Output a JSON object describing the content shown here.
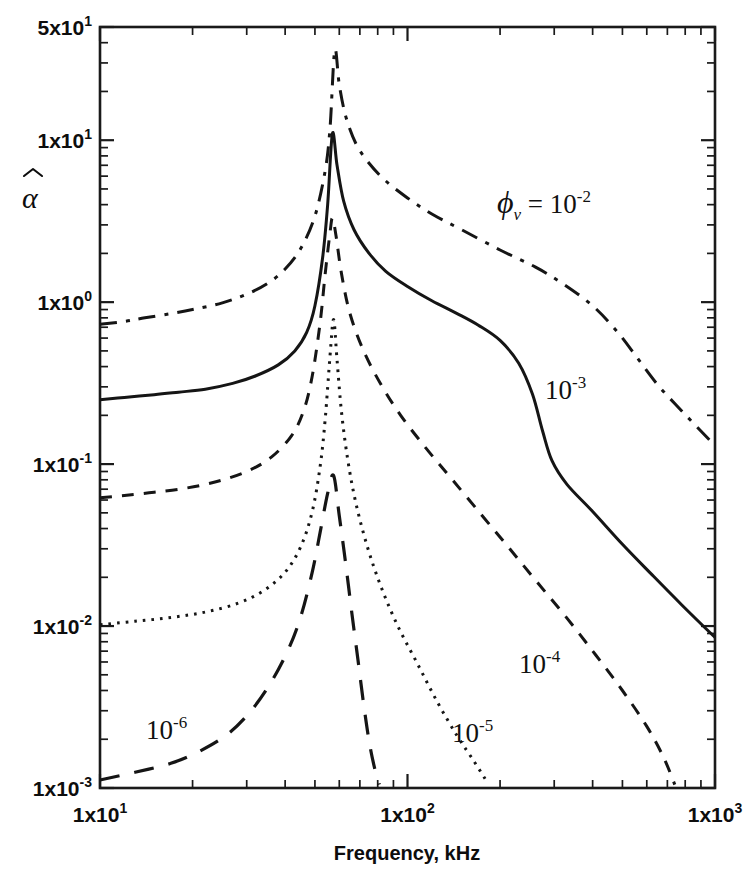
{
  "figure": {
    "background": "#ffffff",
    "ink_color": "#151515"
  },
  "axes": {
    "x": {
      "title": "Frequency, kHz",
      "scale": "log",
      "min": 10,
      "max": 1000,
      "tick_labels": [
        {
          "value": 10,
          "mantissa": "1x10",
          "exponent": "1"
        },
        {
          "value": 100,
          "mantissa": "1x10",
          "exponent": "2"
        },
        {
          "value": 1000,
          "mantissa": "1x10",
          "exponent": "3"
        }
      ]
    },
    "y": {
      "title": "α̂",
      "title_glyph": "α",
      "scale": "log",
      "min": 0.001,
      "max": 50,
      "tick_labels": [
        {
          "value": 50,
          "mantissa": "5x10",
          "exponent": "1"
        },
        {
          "value": 10,
          "mantissa": "1x10",
          "exponent": "1"
        },
        {
          "value": 1,
          "mantissa": "1x10",
          "exponent": "0"
        },
        {
          "value": 0.1,
          "mantissa": "1x10",
          "exponent": "-1"
        },
        {
          "value": 0.01,
          "mantissa": "1x10",
          "exponent": "-2"
        },
        {
          "value": 0.001,
          "mantissa": "1x10",
          "exponent": "-3"
        }
      ]
    }
  },
  "annotations": [
    {
      "id": "phi-1e-2",
      "prefix": "ϕ",
      "subscript": "v",
      "equals": " = ",
      "base": "10",
      "exponent": "-2",
      "x": 497,
      "y": 213
    },
    {
      "id": "phi-1e-3",
      "prefix": "",
      "subscript": "",
      "equals": "",
      "base": "10",
      "exponent": "-3",
      "x": 545,
      "y": 399
    },
    {
      "id": "phi-1e-4",
      "prefix": "",
      "subscript": "",
      "equals": "",
      "base": "10",
      "exponent": "-4",
      "x": 519,
      "y": 673
    },
    {
      "id": "phi-1e-5",
      "prefix": "",
      "subscript": "",
      "equals": "",
      "base": "10",
      "exponent": "-5",
      "x": 452,
      "y": 742
    },
    {
      "id": "phi-1e-6",
      "prefix": "",
      "subscript": "",
      "equals": "",
      "base": "10",
      "exponent": "-6",
      "x": 146,
      "y": 739
    }
  ],
  "chart_data": {
    "type": "line",
    "title": "",
    "xlabel": "Frequency, kHz",
    "ylabel": "alpha-hat",
    "xscale": "log",
    "yscale": "log",
    "xlim": [
      10,
      1000
    ],
    "ylim": [
      0.001,
      50
    ],
    "grid": false,
    "legend": "inline-annotations",
    "series": [
      {
        "name": "phi_v = 10^-2",
        "label": "ϕv = 10-2",
        "dash": "dash-dot",
        "stroke_width": 3.0,
        "peak": {
          "x": 58,
          "y": 36
        },
        "points": [
          [
            10,
            0.73
          ],
          [
            12,
            0.76
          ],
          [
            14,
            0.8
          ],
          [
            17,
            0.85
          ],
          [
            20,
            0.9
          ],
          [
            25,
            0.99
          ],
          [
            30,
            1.12
          ],
          [
            35,
            1.3
          ],
          [
            40,
            1.6
          ],
          [
            45,
            2.15
          ],
          [
            50,
            3.4
          ],
          [
            54,
            6.5
          ],
          [
            56,
            12
          ],
          [
            58,
            36
          ],
          [
            60,
            22
          ],
          [
            63,
            14
          ],
          [
            68,
            9.5
          ],
          [
            75,
            7.2
          ],
          [
            85,
            5.6
          ],
          [
            100,
            4.4
          ],
          [
            120,
            3.5
          ],
          [
            150,
            2.8
          ],
          [
            200,
            2.1
          ],
          [
            260,
            1.65
          ],
          [
            320,
            1.3
          ],
          [
            400,
            0.95
          ],
          [
            480,
            0.66
          ],
          [
            560,
            0.45
          ],
          [
            650,
            0.31
          ],
          [
            750,
            0.23
          ],
          [
            860,
            0.175
          ],
          [
            1000,
            0.13
          ]
        ]
      },
      {
        "name": "phi_v = 10^-3",
        "label": "10-3",
        "dash": "solid",
        "stroke_width": 3.0,
        "peak": {
          "x": 57,
          "y": 11
        },
        "points": [
          [
            10,
            0.25
          ],
          [
            12,
            0.258
          ],
          [
            15,
            0.268
          ],
          [
            18,
            0.278
          ],
          [
            22,
            0.29
          ],
          [
            27,
            0.315
          ],
          [
            32,
            0.35
          ],
          [
            38,
            0.41
          ],
          [
            43,
            0.5
          ],
          [
            47,
            0.65
          ],
          [
            50,
            0.95
          ],
          [
            53,
            1.9
          ],
          [
            55,
            4.0
          ],
          [
            57,
            11
          ],
          [
            59,
            7.0
          ],
          [
            62,
            4.2
          ],
          [
            67,
            2.8
          ],
          [
            75,
            2.0
          ],
          [
            85,
            1.55
          ],
          [
            100,
            1.25
          ],
          [
            120,
            1.02
          ],
          [
            145,
            0.85
          ],
          [
            170,
            0.72
          ],
          [
            200,
            0.58
          ],
          [
            230,
            0.42
          ],
          [
            255,
            0.27
          ],
          [
            275,
            0.16
          ],
          [
            295,
            0.105
          ],
          [
            330,
            0.075
          ],
          [
            400,
            0.051
          ],
          [
            500,
            0.032
          ],
          [
            620,
            0.021
          ],
          [
            780,
            0.0135
          ],
          [
            1000,
            0.0085
          ]
        ]
      },
      {
        "name": "phi_v = 10^-4",
        "label": "10-4",
        "dash": "short-dash",
        "stroke_width": 3.0,
        "peak": {
          "x": 57,
          "y": 3.3
        },
        "points": [
          [
            10,
            0.062
          ],
          [
            12,
            0.064
          ],
          [
            15,
            0.067
          ],
          [
            19,
            0.071
          ],
          [
            24,
            0.078
          ],
          [
            30,
            0.09
          ],
          [
            36,
            0.11
          ],
          [
            42,
            0.15
          ],
          [
            46,
            0.215
          ],
          [
            49,
            0.35
          ],
          [
            52,
            0.75
          ],
          [
            54,
            1.5
          ],
          [
            56,
            2.7
          ],
          [
            57,
            3.3
          ],
          [
            58.5,
            2.6
          ],
          [
            61,
            1.5
          ],
          [
            65,
            0.85
          ],
          [
            72,
            0.5
          ],
          [
            82,
            0.31
          ],
          [
            95,
            0.2
          ],
          [
            115,
            0.125
          ],
          [
            140,
            0.08
          ],
          [
            175,
            0.048
          ],
          [
            215,
            0.03
          ],
          [
            265,
            0.0185
          ],
          [
            330,
            0.0112
          ],
          [
            410,
            0.0066
          ],
          [
            500,
            0.004
          ],
          [
            600,
            0.0024
          ],
          [
            680,
            0.00155
          ],
          [
            740,
            0.00105
          ]
        ]
      },
      {
        "name": "phi_v = 10^-5",
        "label": "10-5",
        "dash": "dotted",
        "stroke_width": 3.0,
        "peak": {
          "x": 57.5,
          "y": 0.78
        },
        "points": [
          [
            10,
            0.0102
          ],
          [
            13,
            0.0107
          ],
          [
            17,
            0.0113
          ],
          [
            22,
            0.0122
          ],
          [
            28,
            0.0138
          ],
          [
            34,
            0.0165
          ],
          [
            40,
            0.0215
          ],
          [
            45,
            0.031
          ],
          [
            49,
            0.051
          ],
          [
            52,
            0.097
          ],
          [
            54,
            0.19
          ],
          [
            56,
            0.47
          ],
          [
            57.5,
            0.78
          ],
          [
            59,
            0.44
          ],
          [
            61,
            0.21
          ],
          [
            64,
            0.105
          ],
          [
            68,
            0.057
          ],
          [
            74,
            0.031
          ],
          [
            82,
            0.0175
          ],
          [
            93,
            0.01
          ],
          [
            108,
            0.0058
          ],
          [
            125,
            0.0034
          ],
          [
            145,
            0.0021
          ],
          [
            165,
            0.00145
          ],
          [
            182,
            0.00108
          ]
        ]
      },
      {
        "name": "phi_v = 10^-6",
        "label": "10-6",
        "dash": "long-dash",
        "stroke_width": 3.2,
        "peak": {
          "x": 57.5,
          "y": 0.085
        },
        "points": [
          [
            10,
            0.00112
          ],
          [
            13,
            0.00125
          ],
          [
            17,
            0.00142
          ],
          [
            21,
            0.00168
          ],
          [
            26,
            0.00215
          ],
          [
            31,
            0.003
          ],
          [
            36,
            0.0045
          ],
          [
            41,
            0.0072
          ],
          [
            45,
            0.0115
          ],
          [
            49,
            0.0215
          ],
          [
            52,
            0.038
          ],
          [
            55,
            0.066
          ],
          [
            57.5,
            0.085
          ],
          [
            60,
            0.048
          ],
          [
            63,
            0.024
          ],
          [
            66,
            0.0118
          ],
          [
            69,
            0.0062
          ],
          [
            72,
            0.0033
          ],
          [
            75,
            0.00195
          ],
          [
            78,
            0.00135
          ],
          [
            81,
            0.00105
          ]
        ]
      }
    ]
  }
}
